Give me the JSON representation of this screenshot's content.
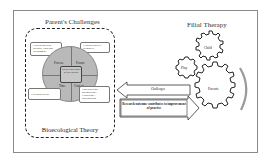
{
  "diagram": {
    "left_title": "Parent's Challenges",
    "right_title": "Filial Therapy",
    "bottom_label": "Bioecological Theory",
    "corner_boxes": {
      "top_left": "• Interaction with therapist, child and environment",
      "top_right": "• Characteristics • Resources",
      "bottom_left": "• Wellness/Stress",
      "bottom_right": "• Microsystem • Mesosystem • Exosystem • Macrosystem"
    },
    "circle_quadrants": {
      "top_left": "Process",
      "top_right": "Person",
      "bottom_left": "Time",
      "bottom_right": "Context"
    },
    "circle_center": "Parent's challenges in filial therapy",
    "challenges_arrow_label": "Challenges",
    "research_arrow_label": "Research outcome contributes to improvement of practice",
    "gears": {
      "child": "Child",
      "play": "Play",
      "parents": "Parents"
    },
    "colors": {
      "circle_fill": "#b9b9b9",
      "frame_border": "#8a8a8a",
      "arc": "#9a9a9a"
    }
  }
}
